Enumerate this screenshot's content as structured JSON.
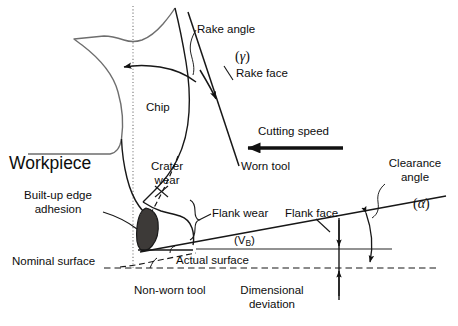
{
  "figure": {
    "type": "technical-schematic",
    "background": "#ffffff",
    "stroke_color": "#111111",
    "workpiece_line_color": "#6b6b6b",
    "builtup_edge_fill": "#3d3a38",
    "width": 458,
    "height": 326
  },
  "labels": {
    "rake_angle": "Rake angle",
    "rake_angle_symbol": "γ",
    "rake_face": "Rake face",
    "chip": "Chip",
    "cutting_speed": "Cutting speed",
    "worn_tool": "Worn tool",
    "workpiece": "Workpiece",
    "crater_wear_line1": "Crater",
    "crater_wear_line2": "wear",
    "builtup_edge_line1": "Built-up edge",
    "builtup_edge_line2": "adhesion",
    "flank_wear": "Flank wear",
    "flank_wear_symbol": "V",
    "flank_wear_subscript": "B",
    "flank_face": "Flank face",
    "clearance_angle_line1": "Clearance",
    "clearance_angle_line2": "angle",
    "clearance_angle_symbol": "α",
    "nominal_surface": "Nominal surface",
    "actual_surface": "Actual surface",
    "non_worn_tool": "Non-worn tool",
    "dimensional_deviation_line1": "Dimensional",
    "dimensional_deviation_line2": "deviation"
  },
  "annotations": {
    "open_paren": "(",
    "close_paren": ")"
  }
}
